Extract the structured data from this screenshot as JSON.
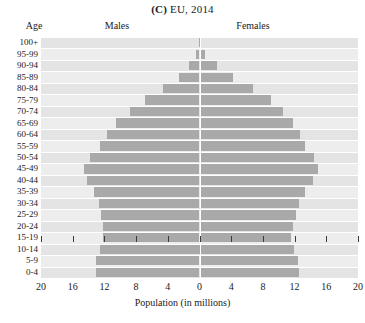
{
  "header": {
    "panel_letter": "(C)",
    "title": "EU, 2014",
    "age_header": "Age",
    "males_header": "Males",
    "females_header": "Females"
  },
  "axis": {
    "x_title": "Population (in millions)",
    "x_ticks": [
      "20",
      "16",
      "12",
      "8",
      "4",
      "0",
      "4",
      "8",
      "12",
      "16",
      "20"
    ],
    "x_tick_values": [
      -20,
      -16,
      -12,
      -8,
      -4,
      0,
      4,
      8,
      12,
      16,
      20
    ]
  },
  "colors": {
    "bar": "#a9a9a9",
    "band_dark": "#e4e4e4",
    "band_light": "#ededed",
    "gridline": "#ffffff",
    "text": "#1a1a1a"
  },
  "chart_data": {
    "type": "bar",
    "subtype": "population-pyramid",
    "title": "(C) EU, 2014",
    "xlabel": "Population (in millions)",
    "ylabel": "Age",
    "xlim": [
      -20,
      20
    ],
    "grid": true,
    "legend_position": "top-inline",
    "categories": [
      "100+",
      "95-99",
      "90-94",
      "85-89",
      "80-84",
      "75-79",
      "70-74",
      "65-69",
      "60-64",
      "55-59",
      "50-54",
      "45-49",
      "40-44",
      "35-39",
      "30-34",
      "25-29",
      "20-24",
      "15-19",
      "10-14",
      "5-9",
      "0-4"
    ],
    "series": [
      {
        "name": "Males",
        "side": "left",
        "values": [
          0.1,
          0.5,
          1.3,
          2.6,
          4.6,
          6.9,
          8.8,
          10.5,
          11.7,
          12.6,
          13.8,
          14.6,
          14.2,
          13.3,
          12.7,
          12.4,
          12.2,
          12.2,
          12.5,
          13.0,
          13.1
        ]
      },
      {
        "name": "Females",
        "side": "right",
        "values": [
          0.1,
          0.7,
          2.2,
          4.2,
          6.7,
          9.0,
          10.5,
          11.8,
          12.7,
          13.3,
          14.4,
          14.9,
          14.3,
          13.3,
          12.6,
          12.2,
          11.8,
          11.6,
          11.9,
          12.4,
          12.5
        ]
      }
    ]
  }
}
